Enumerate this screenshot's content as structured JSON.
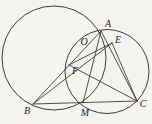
{
  "figure": {
    "background_color": "#f5f4f1",
    "stroke_color": "#3d3d3d",
    "label_color": "#1f1f1f",
    "width": 152,
    "height": 124,
    "circles": [
      {
        "name": "large-circle",
        "cx": 54,
        "cy": 58,
        "r": 52
      },
      {
        "name": "small-circle",
        "cx": 107,
        "cy": 71.5,
        "r": 42
      }
    ],
    "points": {
      "A": {
        "x": 101,
        "y": 31,
        "label_x": 108,
        "label_y": 25
      },
      "B": {
        "x": 33,
        "y": 104,
        "label_x": 27,
        "label_y": 112
      },
      "C": {
        "x": 137,
        "y": 101,
        "label_x": 143,
        "label_y": 105
      },
      "E": {
        "x": 112,
        "y": 43,
        "label_x": 118,
        "label_y": 41
      },
      "F": {
        "x": 69,
        "y": 65,
        "label_x": 75,
        "label_y": 72
      },
      "M": {
        "x": 83,
        "y": 103,
        "label_x": 85,
        "label_y": 114
      },
      "O": {
        "x": 89,
        "y": 44,
        "label_x": 84,
        "label_y": 43
      }
    },
    "segments": [
      {
        "name": "segment-B-C",
        "from": "B",
        "to": "C"
      },
      {
        "name": "segment-B-A",
        "from": "B",
        "to": "A"
      },
      {
        "name": "segment-B-E",
        "from": "B",
        "to": "E"
      },
      {
        "name": "segment-A-C",
        "from": "A",
        "to": "C"
      },
      {
        "name": "segment-A-M",
        "from": "A",
        "to": "M"
      },
      {
        "name": "segment-E-C",
        "from": "E",
        "to": "C"
      },
      {
        "name": "segment-E-F",
        "from": "E",
        "to": "F"
      },
      {
        "name": "segment-F-C",
        "from": "F",
        "to": "C"
      }
    ],
    "labels": [
      "A",
      "B",
      "C",
      "E",
      "F",
      "M",
      "O"
    ]
  }
}
